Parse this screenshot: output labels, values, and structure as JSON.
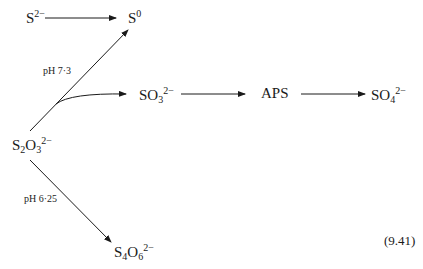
{
  "diagram": {
    "nodes": {
      "sulfide": {
        "base": "S",
        "sub": "",
        "sup": "2−"
      },
      "sulfur": {
        "base": "S",
        "sub": "",
        "sup": "0"
      },
      "sulfite": {
        "base": "SO",
        "sub": "3",
        "sup": "2−"
      },
      "aps": {
        "base": "APS",
        "sub": "",
        "sup": ""
      },
      "sulfate": {
        "base": "SO",
        "sub": "4",
        "sup": "2−"
      },
      "thiosulfate": {
        "base1": "S",
        "sub1": "2",
        "base2": "O",
        "sub2": "3",
        "sup": "2−"
      },
      "tetrathionate": {
        "base1": "S",
        "sub1": "4",
        "base2": "O",
        "sub2": "6",
        "sup": "2−"
      }
    },
    "labels": {
      "ph_upper": "pH 7·3",
      "ph_lower": "pH 6·25"
    },
    "equation_number": "(9.41)",
    "edges": [
      {
        "from": "S2-",
        "to": "S0"
      },
      {
        "from": "S2O3 2-",
        "to": "S0",
        "label": "pH 7·3"
      },
      {
        "from": "S2O3 2-",
        "to": "SO3 2-",
        "curved": true
      },
      {
        "from": "SO3 2-",
        "to": "APS"
      },
      {
        "from": "APS",
        "to": "SO4 2-"
      },
      {
        "from": "S2O3 2-",
        "to": "S4O6 2-",
        "label": "pH 6·25"
      }
    ]
  }
}
